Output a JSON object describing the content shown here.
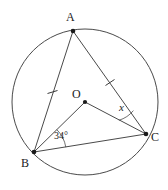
{
  "diagram": {
    "type": "circle-geometry",
    "canvas": {
      "width": 168,
      "height": 190,
      "background": "#ffffff"
    },
    "stroke_color": "#4a4a4a",
    "point_color": "#1a1a1a",
    "circle": {
      "center_label": "O",
      "cx": 85,
      "cy": 102,
      "r": 73
    },
    "points": [
      {
        "id": "A",
        "label": "A",
        "x": 73,
        "y": 31,
        "label_x": 66,
        "label_y": 11
      },
      {
        "id": "B",
        "label": "B",
        "x": 34,
        "y": 152,
        "label_x": 21,
        "label_y": 157
      },
      {
        "id": "C",
        "label": "C",
        "x": 146,
        "y": 134,
        "label_x": 151,
        "label_y": 131
      },
      {
        "id": "O",
        "label": "O",
        "x": 85,
        "y": 102,
        "label_x": 72,
        "label_y": 88
      }
    ],
    "segments": [
      {
        "id": "AB",
        "from": "A",
        "to": "B",
        "kind": "chord",
        "ticks": 1
      },
      {
        "id": "AC",
        "from": "A",
        "to": "C",
        "kind": "chord",
        "ticks": 1
      },
      {
        "id": "BC",
        "from": "B",
        "to": "C",
        "kind": "chord",
        "ticks": 0
      },
      {
        "id": "OB",
        "from": "O",
        "to": "B",
        "kind": "radius",
        "ticks": 0
      },
      {
        "id": "OC",
        "from": "O",
        "to": "C",
        "kind": "radius",
        "ticks": 0
      }
    ],
    "angles": [
      {
        "id": "angle-B",
        "vertex": "B",
        "label": "34°",
        "value": 34,
        "unit": "degrees",
        "between": [
          "BO",
          "BC"
        ],
        "label_x": 54,
        "label_y": 131
      },
      {
        "id": "angle-C",
        "vertex": "C",
        "label": "x",
        "value": null,
        "unit": "unknown",
        "between": [
          "CO",
          "CA"
        ],
        "label_x": 119,
        "label_y": 102
      }
    ],
    "equal_marks": {
      "symbol": "single-tick",
      "applies_to": [
        "AB",
        "AC"
      ],
      "meaning": "AB = AC"
    }
  }
}
